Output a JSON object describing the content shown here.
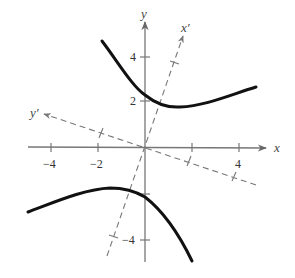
{
  "figure": {
    "axes": {
      "x_label": "x",
      "y_label": "y",
      "x_prime_label": "x′",
      "y_prime_label": "y′",
      "x_ticks": [
        {
          "value": -4,
          "label": "−4"
        },
        {
          "value": -2,
          "label": "−2"
        },
        {
          "value": 2,
          "label": ""
        },
        {
          "value": 4,
          "label": "4"
        }
      ],
      "y_ticks": [
        {
          "value": 4,
          "label": "4"
        },
        {
          "value": 2,
          "label": "2"
        },
        {
          "value": -2,
          "label": ""
        },
        {
          "value": -4,
          "label": "−4"
        }
      ]
    },
    "curve": {
      "type": "hyperbola",
      "branches": [
        "upper",
        "lower"
      ],
      "color": "#111111"
    },
    "colors": {
      "axis": "#777777",
      "dashed_axis": "#777777",
      "curve": "#111111",
      "background": "#ffffff"
    }
  }
}
